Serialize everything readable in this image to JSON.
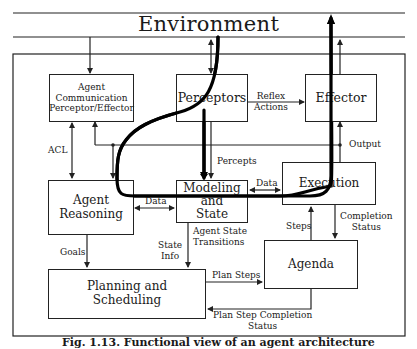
{
  "environment": {
    "label": "Environment"
  },
  "components": {
    "acpe": {
      "lines": [
        "Agent",
        "Communication",
        "Perceptor/Effector"
      ]
    },
    "perceptors": {
      "label": "Perceptors"
    },
    "effector": {
      "label": "Effector"
    },
    "agent_reasoning": {
      "lines": [
        "Agent",
        "Reasoning"
      ]
    },
    "modeling_state": {
      "lines": [
        "Modeling",
        "and",
        "State"
      ]
    },
    "execution": {
      "label": "Execution"
    },
    "agenda": {
      "label": "Agenda"
    },
    "planning": {
      "lines": [
        "Planning and",
        "Scheduling"
      ]
    }
  },
  "edges": {
    "acl": "ACL",
    "reflex_actions": [
      "Reflex",
      "Actions"
    ],
    "output": "Output",
    "percepts": "Percepts",
    "data_left": "Data",
    "data_right": "Data",
    "goals": "Goals",
    "state_info": [
      "State",
      "Info"
    ],
    "agent_state_transitions": [
      "Agent State",
      "Transitions"
    ],
    "steps": "Steps",
    "completion_status": [
      "Completion",
      "Status"
    ],
    "plan_steps": "Plan Steps",
    "plan_step_completion_status": [
      "Plan Step Completion",
      "Status"
    ]
  },
  "caption": {
    "text": "Fig. 1.13. Functional view of an agent architecture"
  },
  "colors": {
    "line": "#222222",
    "thick_path": "#000000",
    "background": "#ffffff"
  }
}
